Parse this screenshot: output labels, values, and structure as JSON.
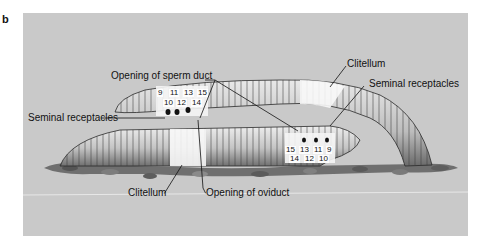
{
  "figure": {
    "panel_letter": "b",
    "colors": {
      "background": "#c9c9c9",
      "worm_light": "#f2f2f2",
      "worm_mid": "#b5b5b5",
      "worm_dark": "#5a5a5a",
      "clitellum": "#fafafa",
      "soil": "#6f6f6f",
      "line": "#111111"
    },
    "labels": {
      "sperm_duct": "Opening of sperm duct",
      "clitellum_top": "Clitellum",
      "seminal_right": "Seminal receptacles",
      "seminal_left": "Seminal receptacles",
      "clitellum_bottom": "Clitellum",
      "oviduct": "Opening of oviduct"
    },
    "upper_worm_segments": {
      "top_row": [
        "9",
        "11",
        "13",
        "15"
      ],
      "bottom_row": [
        "10",
        "12",
        "14"
      ]
    },
    "lower_worm_segments": {
      "top_row": [
        "15",
        "13",
        "11",
        "9"
      ],
      "bottom_row": [
        "14",
        "12",
        "10"
      ]
    }
  }
}
